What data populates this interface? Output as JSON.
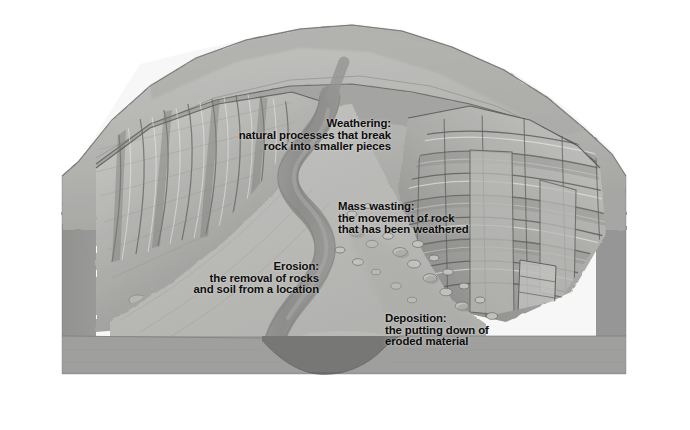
{
  "diagram": {
    "labels": [
      {
        "id": "weathering",
        "name": "weathering-label",
        "title": "Weathering:",
        "line1": "natural processes that break",
        "line2": "rock into smaller pieces",
        "align": "right"
      },
      {
        "id": "mass-wasting",
        "name": "mass-wasting-label",
        "title": "Mass wasting:",
        "line1": "the movement of rock",
        "line2": "that has been weathered",
        "align": "left"
      },
      {
        "id": "erosion",
        "name": "erosion-label",
        "title": "Erosion:",
        "line1": "the removal of rocks",
        "line2": "and soil from a location",
        "align": "right"
      },
      {
        "id": "deposition",
        "name": "deposition-label",
        "title": "Deposition:",
        "line1": "the putting down of",
        "line2": "eroded material",
        "align": "left"
      }
    ],
    "colors": {
      "background": "#ffffff",
      "plateau_top": "#b6b6b4",
      "side_face": "#8d8d8c",
      "front_face": "#9b9b99",
      "canyon_wall_light": "#c9c9c6",
      "canyon_wall_shadow": "#6f6f6d",
      "river": "#8a8a88",
      "river_notch": "#6a6a68",
      "ink": "#0d0d0d"
    }
  }
}
